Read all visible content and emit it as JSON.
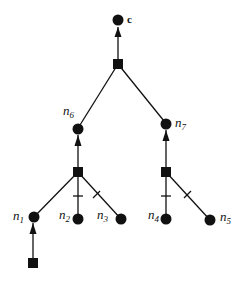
{
  "diagram": {
    "type": "tree",
    "colors": {
      "stroke": "#111111",
      "background": "#ffffff"
    },
    "nodes": {
      "c": {
        "label": "c"
      },
      "n1": {
        "label": "n",
        "sub": "1"
      },
      "n2": {
        "label": "n",
        "sub": "2"
      },
      "n3": {
        "label": "n",
        "sub": "3"
      },
      "n4": {
        "label": "n",
        "sub": "4"
      },
      "n5": {
        "label": "n",
        "sub": "5"
      },
      "n6": {
        "label": "n",
        "sub": "6"
      },
      "n7": {
        "label": "n",
        "sub": "7"
      }
    },
    "edges": [
      {
        "from": "sq_top",
        "to": "c",
        "arrow": true
      },
      {
        "from": "sq_top",
        "to": "n6"
      },
      {
        "from": "sq_top",
        "to": "n7"
      },
      {
        "from": "sq_left",
        "to": "n6",
        "arrow": true
      },
      {
        "from": "sq_left",
        "to": "n1"
      },
      {
        "from": "sq_left",
        "to": "n2",
        "tick": true
      },
      {
        "from": "sq_left",
        "to": "n3",
        "tick": true
      },
      {
        "from": "sq_right",
        "to": "n7",
        "arrow": true
      },
      {
        "from": "sq_right",
        "to": "n4",
        "tick": true
      },
      {
        "from": "sq_right",
        "to": "n5",
        "tick": true
      },
      {
        "from": "sq_bottom",
        "to": "n1",
        "arrow": true
      }
    ],
    "legend": {
      "circle": "node",
      "square": "junction"
    }
  }
}
